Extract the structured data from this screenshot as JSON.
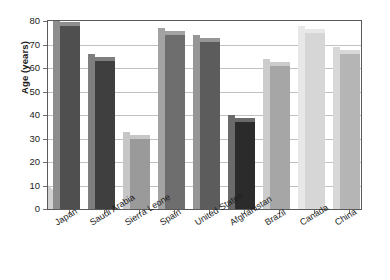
{
  "chart_data": {
    "type": "bar",
    "title": "",
    "subtitle": "",
    "xlabel": "",
    "ylabel": "Age (years)",
    "ylim": [
      0,
      80
    ],
    "ytick_step": 10,
    "yticks": [
      0,
      10,
      20,
      30,
      40,
      50,
      60,
      70,
      80
    ],
    "grid": true,
    "legend": "none",
    "style": "3d-shadow-bars",
    "categories": [
      "Japan",
      "Saudi Arabia",
      "Sierra Leone",
      "Spain",
      "United States",
      "Afghanistan",
      "Brazil",
      "Canada",
      "China"
    ],
    "values": [
      78,
      63,
      30,
      74,
      71,
      37,
      61,
      75,
      66
    ],
    "bar_colors": [
      "#4f4f4f",
      "#3f3f3f",
      "#9a9a9a",
      "#6e6e6e",
      "#5c5c5c",
      "#2b2b2b",
      "#a6a6a6",
      "#d6d6d6",
      "#b5b5b5"
    ],
    "bar_side_colors": [
      "#8e8e8e",
      "#7e7e7e",
      "#c6c6c6",
      "#a3a3a3",
      "#969696",
      "#6a6a6a",
      "#cccccc",
      "#e8e8e8",
      "#d8d8d8"
    ],
    "bars": [
      {
        "category": "Japan",
        "value": 78,
        "color": "#4f4f4f"
      },
      {
        "category": "Saudi Arabia",
        "value": 63,
        "color": "#3f3f3f"
      },
      {
        "category": "Sierra Leone",
        "value": 30,
        "color": "#9a9a9a"
      },
      {
        "category": "Spain",
        "value": 74,
        "color": "#6e6e6e"
      },
      {
        "category": "United States",
        "value": 71,
        "color": "#5c5c5c"
      },
      {
        "category": "Afghanistan",
        "value": 37,
        "color": "#2b2b2b"
      },
      {
        "category": "Brazil",
        "value": 61,
        "color": "#a6a6a6"
      },
      {
        "category": "Canada",
        "value": 75,
        "color": "#d6d6d6"
      },
      {
        "category": "China",
        "value": 66,
        "color": "#b5b5b5"
      }
    ]
  },
  "axis": {
    "y_title": "Age (years)",
    "y_labels": [
      "80",
      "70",
      "60",
      "50",
      "40",
      "30",
      "20",
      "10",
      "0"
    ],
    "x_labels": [
      "Japan",
      "Saudi Arabia",
      "Sierra Leone",
      "Spain",
      "United States",
      "Afghanistan",
      "Brazil",
      "Canada",
      "China"
    ]
  },
  "colors": {
    "background": "#ffffff",
    "frame": "#5a5a5a",
    "gridline": "#c2c2c2",
    "text": "#1d1d1d",
    "floor_shadow": "#cfcfcf"
  }
}
